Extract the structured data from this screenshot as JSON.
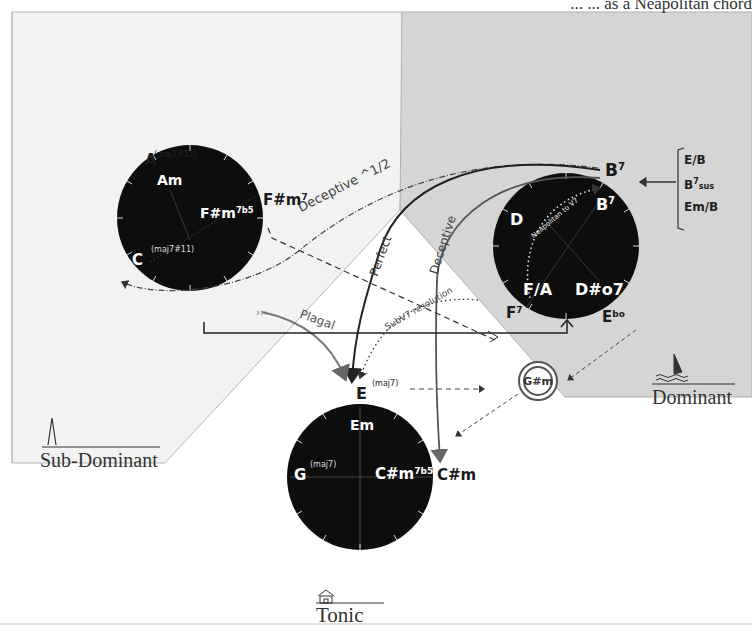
{
  "header": {
    "partial_text": "...  ...  as a Neapolitan chord"
  },
  "regions": {
    "sub_dominant": {
      "label": "Sub-Dominant",
      "icon": "church-steeple-icon"
    },
    "dominant": {
      "label": "Dominant",
      "icon": "sailboat-icon"
    },
    "tonic": {
      "label": "Tonic",
      "icon": "house-icon"
    }
  },
  "circles": {
    "sub_dominant": {
      "outer_labels": {
        "top": "A",
        "top_ext": "(maj7#11)",
        "right": "F#m",
        "right_sup": "7"
      },
      "inner_labels": {
        "top": "Am",
        "right": "F#m",
        "right_sup": "7b5",
        "left": "C",
        "left_ext": "(maj7#11)"
      }
    },
    "dominant": {
      "outer_labels": {
        "top": "B",
        "top_sup": "7",
        "bottom_left": "F",
        "bottom_left_sup": "7",
        "bottom_right": "E",
        "bottom_right_sup": "b",
        "bottom_right_tail": "o"
      },
      "inner_labels": {
        "top_right": "B",
        "top_right_sup": "7",
        "left": "D",
        "bottom_left": "F/A",
        "bottom_right": "D#o7",
        "curve_text": "Neapolitan to V7"
      }
    },
    "tonic": {
      "outer_labels": {
        "top": "E",
        "top_ext": "(maj7)",
        "right": "C#m"
      },
      "inner_labels": {
        "top": "Em",
        "left": "G",
        "left_ext": "(maj7)",
        "right": "C#m",
        "right_sup": "7b5"
      }
    }
  },
  "alternates": {
    "items": [
      "E/B",
      "B7sus",
      "Em/B"
    ],
    "e_over_b": "E/B",
    "b7sus_root": "B",
    "b7sus_sup": "7",
    "b7sus_sub": "sus",
    "em_over_b": "Em/B"
  },
  "isolated_chord": {
    "label": "G#m"
  },
  "arrows": {
    "deceptive_half": "Deceptive ^1/2",
    "perfect": "Perfect",
    "deceptive": "Deceptive",
    "plagal": "Plagal",
    "subv7": "SubV7 resolution"
  },
  "colors": {
    "circle_fill": "#0d0d0d",
    "dominant_bg": "#d6d6d6",
    "subdominant_bg": "#f1f1f1",
    "tonic_bg": "#ffffff",
    "line_dark": "#2a2a2a",
    "line_mid": "#6a6a6a"
  }
}
